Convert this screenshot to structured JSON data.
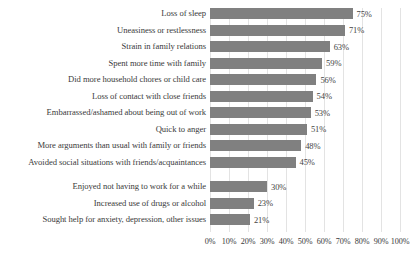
{
  "chart_data": {
    "type": "bar",
    "orientation": "horizontal",
    "title": "",
    "subtitle": "",
    "xlabel": "",
    "ylabel": "",
    "xlim": [
      0,
      100
    ],
    "xticks": [
      "0%",
      "10%",
      "20%",
      "30%",
      "40%",
      "50%",
      "60%",
      "70%",
      "80%",
      "90%",
      "100%"
    ],
    "xtick_values": [
      0,
      10,
      20,
      30,
      40,
      50,
      60,
      70,
      80,
      90,
      100
    ],
    "grid": "vertical",
    "legend": "none",
    "bar_color": "#808080",
    "gridline_color": "#e3e3e3",
    "background": "#ffffff",
    "value_label_suffix": "%",
    "categories": [
      "Loss of sleep",
      "Uneasiness or restlessness",
      "Strain in family relations",
      "Spent more time with family",
      "Did more household chores or child care",
      "Loss of contact with close friends",
      "Embarrassed/ashamed about being out of work",
      "Quick to anger",
      "More arguments than usual with family or friends",
      "Avoided social situations with friends/acquaintances",
      "Enjoyed not having to work for a while",
      "Increased use of drugs or alcohol",
      "Sought help for anxiety, depression, other issues"
    ],
    "values": [
      75,
      71,
      63,
      59,
      56,
      54,
      53,
      51,
      48,
      45,
      30,
      23,
      21
    ],
    "value_labels": [
      "75%",
      "71%",
      "63%",
      "59%",
      "56%",
      "54%",
      "53%",
      "51%",
      "48%",
      "45%",
      "30%",
      "23%",
      "21%"
    ],
    "group_break_after_index": 9
  }
}
